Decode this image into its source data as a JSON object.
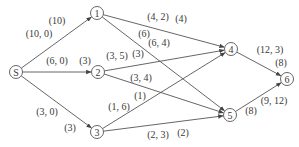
{
  "diagram": {
    "type": "network-flow-graph",
    "nodes": [
      {
        "id": "S",
        "label": "S",
        "x": 16,
        "y": 72
      },
      {
        "id": "1",
        "label": "1",
        "x": 97,
        "y": 13
      },
      {
        "id": "2",
        "label": "2",
        "x": 98,
        "y": 72
      },
      {
        "id": "3",
        "label": "3",
        "x": 97,
        "y": 132
      },
      {
        "id": "4",
        "label": "4",
        "x": 231,
        "y": 49
      },
      {
        "id": "5",
        "label": "5",
        "x": 230,
        "y": 115
      },
      {
        "id": "6",
        "label": "6",
        "x": 287,
        "y": 79
      }
    ],
    "edges": [
      {
        "from": "S",
        "to": "1",
        "pair": "(10, 0)",
        "flow": "(10)"
      },
      {
        "from": "S",
        "to": "2",
        "pair": "(6, 0)",
        "flow": "(3)"
      },
      {
        "from": "S",
        "to": "3",
        "pair": "(3, 0)",
        "flow": "(3)"
      },
      {
        "from": "1",
        "to": "4",
        "pair": "(4, 2)",
        "flow": "(4)"
      },
      {
        "from": "1",
        "to": "5",
        "pair": "(6, 4)",
        "flow": "(6)"
      },
      {
        "from": "2",
        "to": "4",
        "pair": "(3, 5)",
        "flow": "(3)"
      },
      {
        "from": "2",
        "to": "5",
        "pair": "(3, 4)",
        "flow": ""
      },
      {
        "from": "3",
        "to": "4",
        "pair": "(1, 6)",
        "flow": "(1)"
      },
      {
        "from": "3",
        "to": "5",
        "pair": "(2, 3)",
        "flow": "(2)"
      },
      {
        "from": "4",
        "to": "6",
        "pair": "(12, 3)",
        "flow": "(8)"
      },
      {
        "from": "5",
        "to": "6",
        "pair": "(9, 12)",
        "flow": "(8)"
      }
    ],
    "labels": [
      {
        "text": "(10)",
        "x": 57,
        "y": 24
      },
      {
        "text": "(10, 0)",
        "x": 39,
        "y": 37
      },
      {
        "text": "(6, 0)",
        "x": 57,
        "y": 64
      },
      {
        "text": "(3)",
        "x": 85,
        "y": 64
      },
      {
        "text": "(3, 0)",
        "x": 47,
        "y": 115
      },
      {
        "text": "(3)",
        "x": 70,
        "y": 131
      },
      {
        "text": "(4, 2)",
        "x": 158,
        "y": 20
      },
      {
        "text": "(4)",
        "x": 181,
        "y": 22
      },
      {
        "text": "(6)",
        "x": 144,
        "y": 37
      },
      {
        "text": "(6, 4)",
        "x": 159,
        "y": 46
      },
      {
        "text": "(3, 5)",
        "x": 117,
        "y": 59
      },
      {
        "text": "(3)",
        "x": 138,
        "y": 57
      },
      {
        "text": "(3, 4)",
        "x": 141,
        "y": 81
      },
      {
        "text": "(1)",
        "x": 140,
        "y": 99
      },
      {
        "text": "(1, 6)",
        "x": 119,
        "y": 110
      },
      {
        "text": "(2, 3)",
        "x": 158,
        "y": 138
      },
      {
        "text": "(2)",
        "x": 183,
        "y": 136
      },
      {
        "text": "(12, 3)",
        "x": 270,
        "y": 53
      },
      {
        "text": "(8)",
        "x": 281,
        "y": 66
      },
      {
        "text": "(8)",
        "x": 251,
        "y": 114
      },
      {
        "text": "(9, 12)",
        "x": 274,
        "y": 104
      }
    ]
  }
}
